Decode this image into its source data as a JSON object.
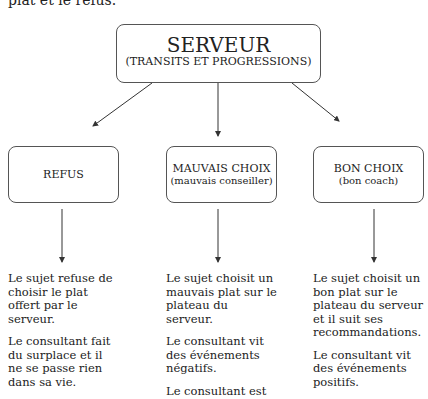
{
  "intro_text": "plat et le refus.",
  "root": {
    "title": "SERVEUR",
    "subtitle": "(TRANSITS ET PROGRESSIONS)"
  },
  "branches": [
    {
      "title": "REFUS",
      "subtitle": "",
      "paragraphs": [
        "Le sujet refuse de choisir le plat offert par le serveur.",
        "Le consultant fait du surplace et il ne se passe rien dans sa vie."
      ]
    },
    {
      "title": "MAUVAIS CHOIX",
      "subtitle": "(mauvais conseiller)",
      "paragraphs": [
        "Le sujet choisit un mauvais plat sur le plateau du serveur.",
        "Le consultant vit des événements négatifs.",
        "Le consultant est"
      ]
    },
    {
      "title": "BON CHOIX",
      "subtitle": "(bon coach)",
      "paragraphs": [
        "Le sujet choisit un bon plat sur le plateau du serveur et il suit ses recommandations.",
        "Le consultant vit des événements positifs."
      ]
    }
  ]
}
